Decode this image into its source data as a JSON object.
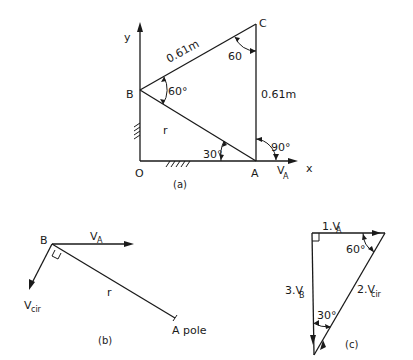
{
  "figure_a": {
    "caption": "(a)",
    "axis_y": "y",
    "axis_x": "x",
    "point_O": "O",
    "point_A": "A",
    "point_B": "B",
    "point_C": "C",
    "length_BC": "0.61m",
    "length_CA": "0.61m",
    "link_r": "r",
    "angle_B": "60°",
    "angle_C": "60",
    "angle_A_OAB": "30°",
    "angle_A_vert": "90°",
    "velocity_label_main": "V",
    "velocity_label_sub": "A"
  },
  "figure_b": {
    "caption": "(b)",
    "point_B": "B",
    "va_main": "V",
    "va_sub": "A",
    "vcir_main": "V",
    "vcir_sub": "cir",
    "link_r": "r",
    "pole_label": "A pole"
  },
  "figure_c": {
    "caption": "(c)",
    "side1_prefix": "1.",
    "side1_main": "V",
    "side1_sub": "A",
    "side2_prefix": "2.",
    "side2_main": "V",
    "side2_sub": "cir",
    "side3_prefix": "3.",
    "side3_main": "V",
    "side3_sub": "B",
    "angle_top": "60°",
    "angle_bottom": "30°"
  }
}
